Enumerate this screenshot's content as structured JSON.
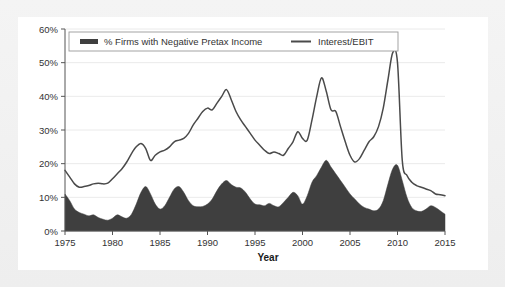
{
  "card": {
    "background": "#ffffff",
    "page_background": "#f1f1f1"
  },
  "chart_data": {
    "type": "line",
    "title": "",
    "subtitle": "",
    "xlabel": "Year",
    "ylabel": "",
    "xlim": [
      1975,
      2015
    ],
    "ylim": [
      0,
      60
    ],
    "grid": true,
    "legend_position": "top-inside",
    "y_ticks": [
      "0%",
      "10%",
      "20%",
      "30%",
      "40%",
      "50%",
      "60%"
    ],
    "y_tick_values": [
      0,
      10,
      20,
      30,
      40,
      50,
      60
    ],
    "x_ticks": [
      "1975",
      "1980",
      "1985",
      "1990",
      "1995",
      "2000",
      "2005",
      "2010",
      "2015"
    ],
    "x_tick_values": [
      1975,
      1980,
      1985,
      1990,
      1995,
      2000,
      2005,
      2010,
      2015
    ],
    "colors": {
      "area_fill": "#3f3f3f",
      "line": "#4a4a4a",
      "gridline": "#e4e4e4",
      "axis": "#555555"
    },
    "series": [
      {
        "name": "% Firms with Negative Pretax Income",
        "render": "area",
        "color": "#3f3f3f",
        "x": [
          1975,
          1975.5,
          1976,
          1976.5,
          1977,
          1977.5,
          1978,
          1978.5,
          1979,
          1979.5,
          1980,
          1980.5,
          1981,
          1981.5,
          1982,
          1982.5,
          1983,
          1983.5,
          1984,
          1984.5,
          1985,
          1985.5,
          1986,
          1986.5,
          1987,
          1987.5,
          1988,
          1988.5,
          1989,
          1989.5,
          1990,
          1990.5,
          1991,
          1991.5,
          1992,
          1992.5,
          1993,
          1993.5,
          1994,
          1994.5,
          1995,
          1995.5,
          1996,
          1996.5,
          1997,
          1997.5,
          1998,
          1998.5,
          1999,
          1999.5,
          2000,
          2000.5,
          2001,
          2001.5,
          2002,
          2002.5,
          2003,
          2003.5,
          2004,
          2004.5,
          2005,
          2005.5,
          2006,
          2006.5,
          2007,
          2007.5,
          2008,
          2008.5,
          2009,
          2009.5,
          2010,
          2010.5,
          2011,
          2011.5,
          2012,
          2012.5,
          2013,
          2013.5,
          2014,
          2014.5,
          2015
        ],
        "values": [
          11.0,
          9.0,
          6.5,
          5.5,
          5.0,
          4.5,
          4.8,
          4.0,
          3.5,
          3.2,
          3.8,
          4.8,
          4.2,
          3.8,
          5.0,
          8.0,
          11.5,
          13.2,
          11.0,
          8.0,
          6.5,
          7.5,
          10.0,
          12.5,
          13.2,
          11.5,
          9.0,
          7.5,
          7.2,
          7.3,
          8.0,
          9.5,
          12.0,
          14.0,
          15.0,
          13.8,
          13.0,
          12.8,
          11.5,
          9.5,
          8.0,
          7.8,
          7.5,
          8.2,
          7.5,
          7.2,
          8.5,
          10.0,
          11.5,
          10.5,
          8.0,
          10.5,
          14.5,
          16.5,
          19.0,
          21.0,
          19.0,
          17.0,
          15.0,
          13.0,
          11.0,
          9.5,
          8.0,
          7.0,
          6.5,
          6.0,
          6.5,
          9.0,
          14.0,
          18.5,
          19.5,
          15.0,
          10.0,
          7.0,
          6.0,
          5.8,
          6.5,
          7.5,
          7.0,
          6.0,
          5.0
        ]
      },
      {
        "name": "Interest/EBIT",
        "render": "line",
        "color": "#4a4a4a",
        "x": [
          1975,
          1975.5,
          1976,
          1976.5,
          1977,
          1977.5,
          1978,
          1978.5,
          1979,
          1979.5,
          1980,
          1980.5,
          1981,
          1981.5,
          1982,
          1982.5,
          1983,
          1983.5,
          1984,
          1984.5,
          1985,
          1985.5,
          1986,
          1986.5,
          1987,
          1987.5,
          1988,
          1988.5,
          1989,
          1989.5,
          1990,
          1990.5,
          1991,
          1991.5,
          1992,
          1992.5,
          1993,
          1993.5,
          1994,
          1994.5,
          1995,
          1995.5,
          1996,
          1996.5,
          1997,
          1997.5,
          1998,
          1998.5,
          1999,
          1999.5,
          2000,
          2000.5,
          2001,
          2001.5,
          2002,
          2002.5,
          2003,
          2003.5,
          2004,
          2004.5,
          2005,
          2005.5,
          2006,
          2006.5,
          2007,
          2007.5,
          2008,
          2008.5,
          2009,
          2009.5,
          2010,
          2010.5,
          2011,
          2011.5,
          2012,
          2012.5,
          2013,
          2013.5,
          2014,
          2014.5,
          2015
        ],
        "values": [
          18.0,
          16.0,
          14.0,
          13.0,
          13.2,
          13.5,
          14.0,
          14.2,
          14.0,
          14.2,
          15.5,
          17.0,
          18.5,
          20.5,
          23.0,
          25.0,
          26.0,
          24.5,
          21.0,
          22.5,
          23.5,
          24.0,
          25.0,
          26.5,
          27.0,
          27.5,
          29.0,
          31.5,
          33.5,
          35.5,
          36.5,
          36.0,
          38.0,
          40.0,
          42.0,
          39.0,
          35.5,
          33.0,
          31.0,
          29.0,
          27.0,
          25.5,
          24.0,
          23.0,
          23.5,
          23.0,
          22.5,
          24.5,
          26.5,
          29.5,
          27.5,
          27.0,
          33.0,
          40.0,
          45.5,
          41.5,
          36.0,
          35.5,
          31.0,
          26.5,
          22.5,
          20.5,
          21.5,
          24.0,
          26.5,
          28.0,
          31.0,
          36.5,
          45.0,
          53.0,
          50.0,
          21.0,
          16.5,
          14.5,
          13.5,
          13.0,
          12.5,
          12.0,
          11.0,
          10.8,
          10.5
        ]
      }
    ],
    "annotations": []
  },
  "legend": {
    "items": [
      {
        "label": "% Firms with Negative Pretax Income",
        "marker": "thick-bar",
        "color": "#3f3f3f"
      },
      {
        "label": "Interest/EBIT",
        "marker": "thin-line",
        "color": "#4a4a4a"
      }
    ]
  }
}
